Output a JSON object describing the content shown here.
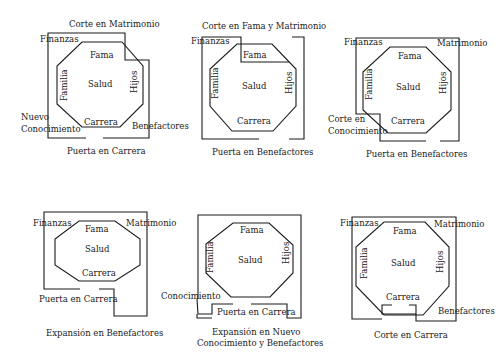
{
  "panels": [
    {
      "caption": "Puerta en Carrera",
      "top_note": "Corte en Matrimonio",
      "labels": {
        "fama": "Fama",
        "salud": "Salud",
        "familia": "Familia",
        "hijos": "Hijos",
        "carrera": "Carrera",
        "finanzas": "Finanzas",
        "benefactores": "Benefactores",
        "conocimiento_1": "Nuevo",
        "conocimiento_2": "Conocimiento"
      }
    },
    {
      "caption": "Puerta en Benefactores",
      "top_note": "Corte en Fama y Matrimonio",
      "labels": {
        "fama": "Fama",
        "salud": "Salud",
        "familia": "Familia",
        "hijos": "Hijos",
        "carrera": "Carrera",
        "finanzas": "Finanzas"
      }
    },
    {
      "caption": "Puerta en Benefactores",
      "labels": {
        "fama": "Fama",
        "salud": "Salud",
        "familia": "Familia",
        "hijos": "Hijos",
        "carrera": "Carrera",
        "finanzas": "Finanzas",
        "matrimonio": "Matrimonio",
        "corte_1": "Corte en",
        "corte_2": "Conocimiento"
      }
    },
    {
      "caption": "Expansión en Benefactores",
      "labels": {
        "fama": "Fama",
        "salud": "Salud",
        "carrera": "Carrera",
        "finanzas": "Finanzas",
        "matrimonio": "Matrimonio",
        "puerta": "Puerta en Carrera"
      }
    },
    {
      "caption_1": "Expansión en Nuevo",
      "caption_2": "Conocimiento y Benefactores",
      "labels": {
        "fama": "Fama",
        "salud": "Salud",
        "familia": "Familia",
        "hijos": "Hijos",
        "conocimiento": "Conocimiento",
        "puerta": "Puerta en Carrera"
      }
    },
    {
      "caption": "Corte en Carrera",
      "labels": {
        "fama": "Fama",
        "salud": "Salud",
        "familia": "Familia",
        "hijos": "Hijos",
        "carrera": "Carrera",
        "finanzas": "Finanzas",
        "matrimonio": "Matrimonio",
        "benefactores": "Benefactores"
      }
    }
  ]
}
